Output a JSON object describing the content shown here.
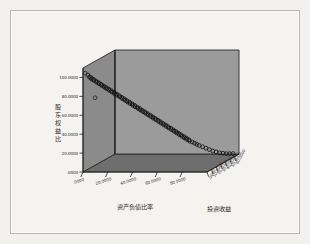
{
  "window": {
    "background_color": "#f2f1ed",
    "frame_border_color": "#b9b8b4"
  },
  "chart_data": {
    "type": "scatter",
    "projection": "3d",
    "title": "",
    "xlabel": "资产负债比率",
    "ylabel": "股东权益比",
    "zlabel": "投资收益",
    "xlim": [
      0,
      100
    ],
    "ylim": [
      0,
      110
    ],
    "zlim": [
      0,
      70
    ],
    "grid": false,
    "legend": null,
    "xticks": [
      ".0000",
      "20.0000",
      "40.0000",
      "60.0000",
      "80.0000"
    ],
    "xtick_values": [
      0,
      20,
      40,
      60,
      80
    ],
    "yticks": [
      ".0000",
      "20.0000",
      "40.0000",
      "60.0000",
      "80.0000",
      "100.0000"
    ],
    "ytick_values": [
      0,
      20,
      40,
      60,
      80,
      100
    ],
    "zticks": [
      ".0000",
      "10.0000",
      "20.0000",
      "30.0000",
      "40.0000",
      "50.0000",
      "60.0000"
    ],
    "ztick_values": [
      0,
      10,
      20,
      30,
      40,
      50,
      60
    ],
    "marker_style": "open-circle",
    "marker_color": "#1a1a1a",
    "wall_left_color": "#8c8c8c",
    "wall_back_color": "#9a9a9a",
    "floor_color": "#6e6e6e",
    "edge_color": "#2a2a2a",
    "series": [
      {
        "name": "观测值",
        "description": "股东权益比 与 资产负债比率 呈强负相关的点云",
        "points": [
          {
            "x": 2.5,
            "y": 101.5,
            "z": 4
          },
          {
            "x": 3.4,
            "y": 99.0,
            "z": 5
          },
          {
            "x": 4.2,
            "y": 98.2,
            "z": 6
          },
          {
            "x": 5.0,
            "y": 97.0,
            "z": 5
          },
          {
            "x": 5.8,
            "y": 96.1,
            "z": 7
          },
          {
            "x": 6.6,
            "y": 95.2,
            "z": 6
          },
          {
            "x": 7.5,
            "y": 94.0,
            "z": 8
          },
          {
            "x": 8.3,
            "y": 93.1,
            "z": 7
          },
          {
            "x": 9.2,
            "y": 92.0,
            "z": 9
          },
          {
            "x": 10.0,
            "y": 91.2,
            "z": 8
          },
          {
            "x": 10.9,
            "y": 90.0,
            "z": 10
          },
          {
            "x": 11.8,
            "y": 89.1,
            "z": 9
          },
          {
            "x": 12.6,
            "y": 88.0,
            "z": 11
          },
          {
            "x": 13.5,
            "y": 87.0,
            "z": 10
          },
          {
            "x": 14.3,
            "y": 86.1,
            "z": 12
          },
          {
            "x": 15.2,
            "y": 85.0,
            "z": 11
          },
          {
            "x": 16.0,
            "y": 84.2,
            "z": 13
          },
          {
            "x": 16.9,
            "y": 83.0,
            "z": 12
          },
          {
            "x": 17.8,
            "y": 82.1,
            "z": 14
          },
          {
            "x": 18.6,
            "y": 81.0,
            "z": 13
          },
          {
            "x": 19.5,
            "y": 80.2,
            "z": 15
          },
          {
            "x": 20.3,
            "y": 79.0,
            "z": 14
          },
          {
            "x": 21.2,
            "y": 78.1,
            "z": 16
          },
          {
            "x": 22.0,
            "y": 77.0,
            "z": 15
          },
          {
            "x": 22.9,
            "y": 76.2,
            "z": 17
          },
          {
            "x": 23.8,
            "y": 75.0,
            "z": 16
          },
          {
            "x": 24.6,
            "y": 74.1,
            "z": 18
          },
          {
            "x": 25.5,
            "y": 73.0,
            "z": 17
          },
          {
            "x": 26.3,
            "y": 72.2,
            "z": 19
          },
          {
            "x": 27.2,
            "y": 71.0,
            "z": 18
          },
          {
            "x": 28.0,
            "y": 70.1,
            "z": 20
          },
          {
            "x": 28.9,
            "y": 69.0,
            "z": 19
          },
          {
            "x": 29.8,
            "y": 68.2,
            "z": 21
          },
          {
            "x": 30.6,
            "y": 67.0,
            "z": 20
          },
          {
            "x": 31.5,
            "y": 66.1,
            "z": 22
          },
          {
            "x": 32.3,
            "y": 65.0,
            "z": 21
          },
          {
            "x": 33.2,
            "y": 64.2,
            "z": 23
          },
          {
            "x": 34.0,
            "y": 63.0,
            "z": 22
          },
          {
            "x": 34.9,
            "y": 62.1,
            "z": 24
          },
          {
            "x": 35.8,
            "y": 61.0,
            "z": 23
          },
          {
            "x": 36.6,
            "y": 60.2,
            "z": 25
          },
          {
            "x": 37.5,
            "y": 59.0,
            "z": 24
          },
          {
            "x": 38.3,
            "y": 58.1,
            "z": 26
          },
          {
            "x": 39.2,
            "y": 57.0,
            "z": 25
          },
          {
            "x": 40.0,
            "y": 56.2,
            "z": 27
          },
          {
            "x": 40.9,
            "y": 55.0,
            "z": 26
          },
          {
            "x": 41.8,
            "y": 54.1,
            "z": 28
          },
          {
            "x": 42.6,
            "y": 53.0,
            "z": 27
          },
          {
            "x": 43.5,
            "y": 52.2,
            "z": 29
          },
          {
            "x": 44.3,
            "y": 51.0,
            "z": 28
          },
          {
            "x": 45.2,
            "y": 50.1,
            "z": 30
          },
          {
            "x": 46.0,
            "y": 49.0,
            "z": 29
          },
          {
            "x": 46.9,
            "y": 48.2,
            "z": 31
          },
          {
            "x": 47.8,
            "y": 47.0,
            "z": 30
          },
          {
            "x": 48.6,
            "y": 46.1,
            "z": 32
          },
          {
            "x": 49.5,
            "y": 45.0,
            "z": 31
          },
          {
            "x": 50.3,
            "y": 44.2,
            "z": 33
          },
          {
            "x": 51.2,
            "y": 43.0,
            "z": 32
          },
          {
            "x": 52.0,
            "y": 42.1,
            "z": 34
          },
          {
            "x": 52.9,
            "y": 41.0,
            "z": 33
          },
          {
            "x": 53.8,
            "y": 40.2,
            "z": 35
          },
          {
            "x": 54.6,
            "y": 39.0,
            "z": 34
          },
          {
            "x": 55.5,
            "y": 38.1,
            "z": 36
          },
          {
            "x": 56.3,
            "y": 37.0,
            "z": 35
          },
          {
            "x": 57.2,
            "y": 36.2,
            "z": 37
          },
          {
            "x": 58.0,
            "y": 35.0,
            "z": 36
          },
          {
            "x": 58.9,
            "y": 34.1,
            "z": 38
          },
          {
            "x": 59.8,
            "y": 33.0,
            "z": 37
          },
          {
            "x": 60.6,
            "y": 32.2,
            "z": 39
          },
          {
            "x": 61.5,
            "y": 31.0,
            "z": 38
          },
          {
            "x": 62.3,
            "y": 30.1,
            "z": 40
          },
          {
            "x": 63.2,
            "y": 29.0,
            "z": 39
          },
          {
            "x": 64.0,
            "y": 28.2,
            "z": 41
          },
          {
            "x": 64.9,
            "y": 27.0,
            "z": 40
          },
          {
            "x": 65.8,
            "y": 26.1,
            "z": 42
          },
          {
            "x": 66.6,
            "y": 25.0,
            "z": 41
          },
          {
            "x": 67.5,
            "y": 24.2,
            "z": 43
          },
          {
            "x": 68.3,
            "y": 23.0,
            "z": 42
          },
          {
            "x": 69.2,
            "y": 22.1,
            "z": 44
          },
          {
            "x": 70.0,
            "y": 21.0,
            "z": 43
          },
          {
            "x": 71.5,
            "y": 19.5,
            "z": 45
          },
          {
            "x": 73.0,
            "y": 18.0,
            "z": 46
          },
          {
            "x": 74.5,
            "y": 16.5,
            "z": 47
          },
          {
            "x": 76.0,
            "y": 15.0,
            "z": 48
          },
          {
            "x": 78.0,
            "y": 13.0,
            "z": 50
          },
          {
            "x": 80.0,
            "y": 11.0,
            "z": 52
          },
          {
            "x": 82.0,
            "y": 9.0,
            "z": 54
          },
          {
            "x": 84.0,
            "y": 7.0,
            "z": 56
          },
          {
            "x": 86.0,
            "y": 5.5,
            "z": 58
          },
          {
            "x": 88.0,
            "y": 4.0,
            "z": 60
          },
          {
            "x": 90.0,
            "y": 3.0,
            "z": 62
          },
          {
            "x": 92.0,
            "y": 2.0,
            "z": 64
          },
          {
            "x": 94.0,
            "y": 1.5,
            "z": 66
          },
          {
            "x": 96.0,
            "y": 1.0,
            "z": 68
          }
        ]
      },
      {
        "name": "离群值",
        "description": "左侧墙面附近的孤立观测点",
        "points": [
          {
            "x": 1.0,
            "y": 104.0,
            "z": 2
          },
          {
            "x": 9.0,
            "y": 78.0,
            "z": 2
          }
        ]
      }
    ]
  }
}
